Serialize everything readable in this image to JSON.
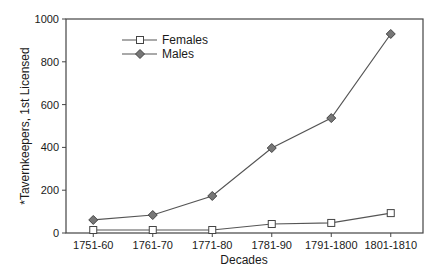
{
  "chart_data": {
    "type": "line",
    "title": "",
    "xlabel": "Decades",
    "ylabel": "*Tavernkeepers, 1st Licensed",
    "categories": [
      "1751-60",
      "1761-70",
      "1771-80",
      "1781-90",
      "1791-1800",
      "1801-1810"
    ],
    "series": [
      {
        "name": "Females",
        "marker": "square-open",
        "color": "#555555",
        "values": [
          14,
          14,
          14,
          42,
          47,
          93
        ]
      },
      {
        "name": "Males",
        "marker": "diamond-filled",
        "color": "#555555",
        "values": [
          61,
          84,
          173,
          397,
          537,
          930
        ]
      }
    ],
    "ylim": [
      0,
      1000
    ],
    "yticks": [
      0,
      200,
      400,
      600,
      800,
      1000
    ],
    "grid": false,
    "legend_position": "upper-left-inside"
  }
}
